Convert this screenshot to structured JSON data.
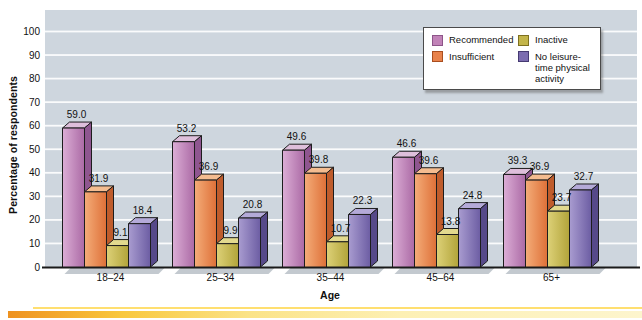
{
  "figure": {
    "y_axis_title": "Percentage of respondents",
    "x_axis_title": "Age",
    "background": "#ffffff",
    "plot_bg": "#ced6de",
    "grid_color": "#ffffff",
    "baseline_color": "#1a1a1a",
    "bar_outline": "#1d1d1d",
    "shadow_color": "#b9c0c7",
    "text_color": "#111111",
    "bottom_accent": {
      "line_color": "#ffdf70",
      "bar_gradient": [
        "#ee9220",
        "#f3a62a",
        "#f9c83e",
        "#fbe387",
        "#fdf0b4",
        "#fdf5cd"
      ]
    }
  },
  "legend": {
    "position": "top-right",
    "bg": "#ffffff",
    "border": "#4a4a4a"
  },
  "chart_data": {
    "type": "bar",
    "title": "",
    "xlabel": "Age",
    "ylabel": "Percentage of respondents",
    "ylim": [
      0,
      100
    ],
    "ytick_step": 10,
    "grid": true,
    "value_labels": true,
    "legend_position": "top-right",
    "categories": [
      "18–24",
      "25–34",
      "35–44",
      "45–64",
      "65+"
    ],
    "series": [
      {
        "name": "Recommended",
        "values": [
          59.0,
          53.2,
          49.6,
          46.6,
          39.3
        ],
        "color": "#c183b8",
        "front": [
          "#dcaed6",
          "#ab6aa5"
        ],
        "side": "#8f5690",
        "top_face": "#debfdb",
        "border": "#8d5589"
      },
      {
        "name": "Insufficient",
        "values": [
          31.9,
          36.9,
          39.8,
          39.6,
          36.9
        ],
        "color": "#e8824b",
        "front": [
          "#f4ad79",
          "#de7038"
        ],
        "side": "#bf5c2c",
        "top_face": "#f4bc90",
        "border": "#a94e1f"
      },
      {
        "name": "Inactive",
        "values": [
          9.1,
          9.9,
          10.7,
          13.8,
          23.7
        ],
        "color": "#c3b54a",
        "front": [
          "#ddd178",
          "#b2a43a"
        ],
        "side": "#93862d",
        "top_face": "#e2d98e",
        "border": "#7d7020"
      },
      {
        "name": "No leisure-time physical activity",
        "values": [
          18.4,
          20.8,
          22.3,
          24.8,
          32.7
        ],
        "color": "#7b6cb0",
        "front": [
          "#a99cd0",
          "#6c5da3"
        ],
        "side": "#564989",
        "top_face": "#b4aad8",
        "border": "#453a72"
      }
    ]
  }
}
